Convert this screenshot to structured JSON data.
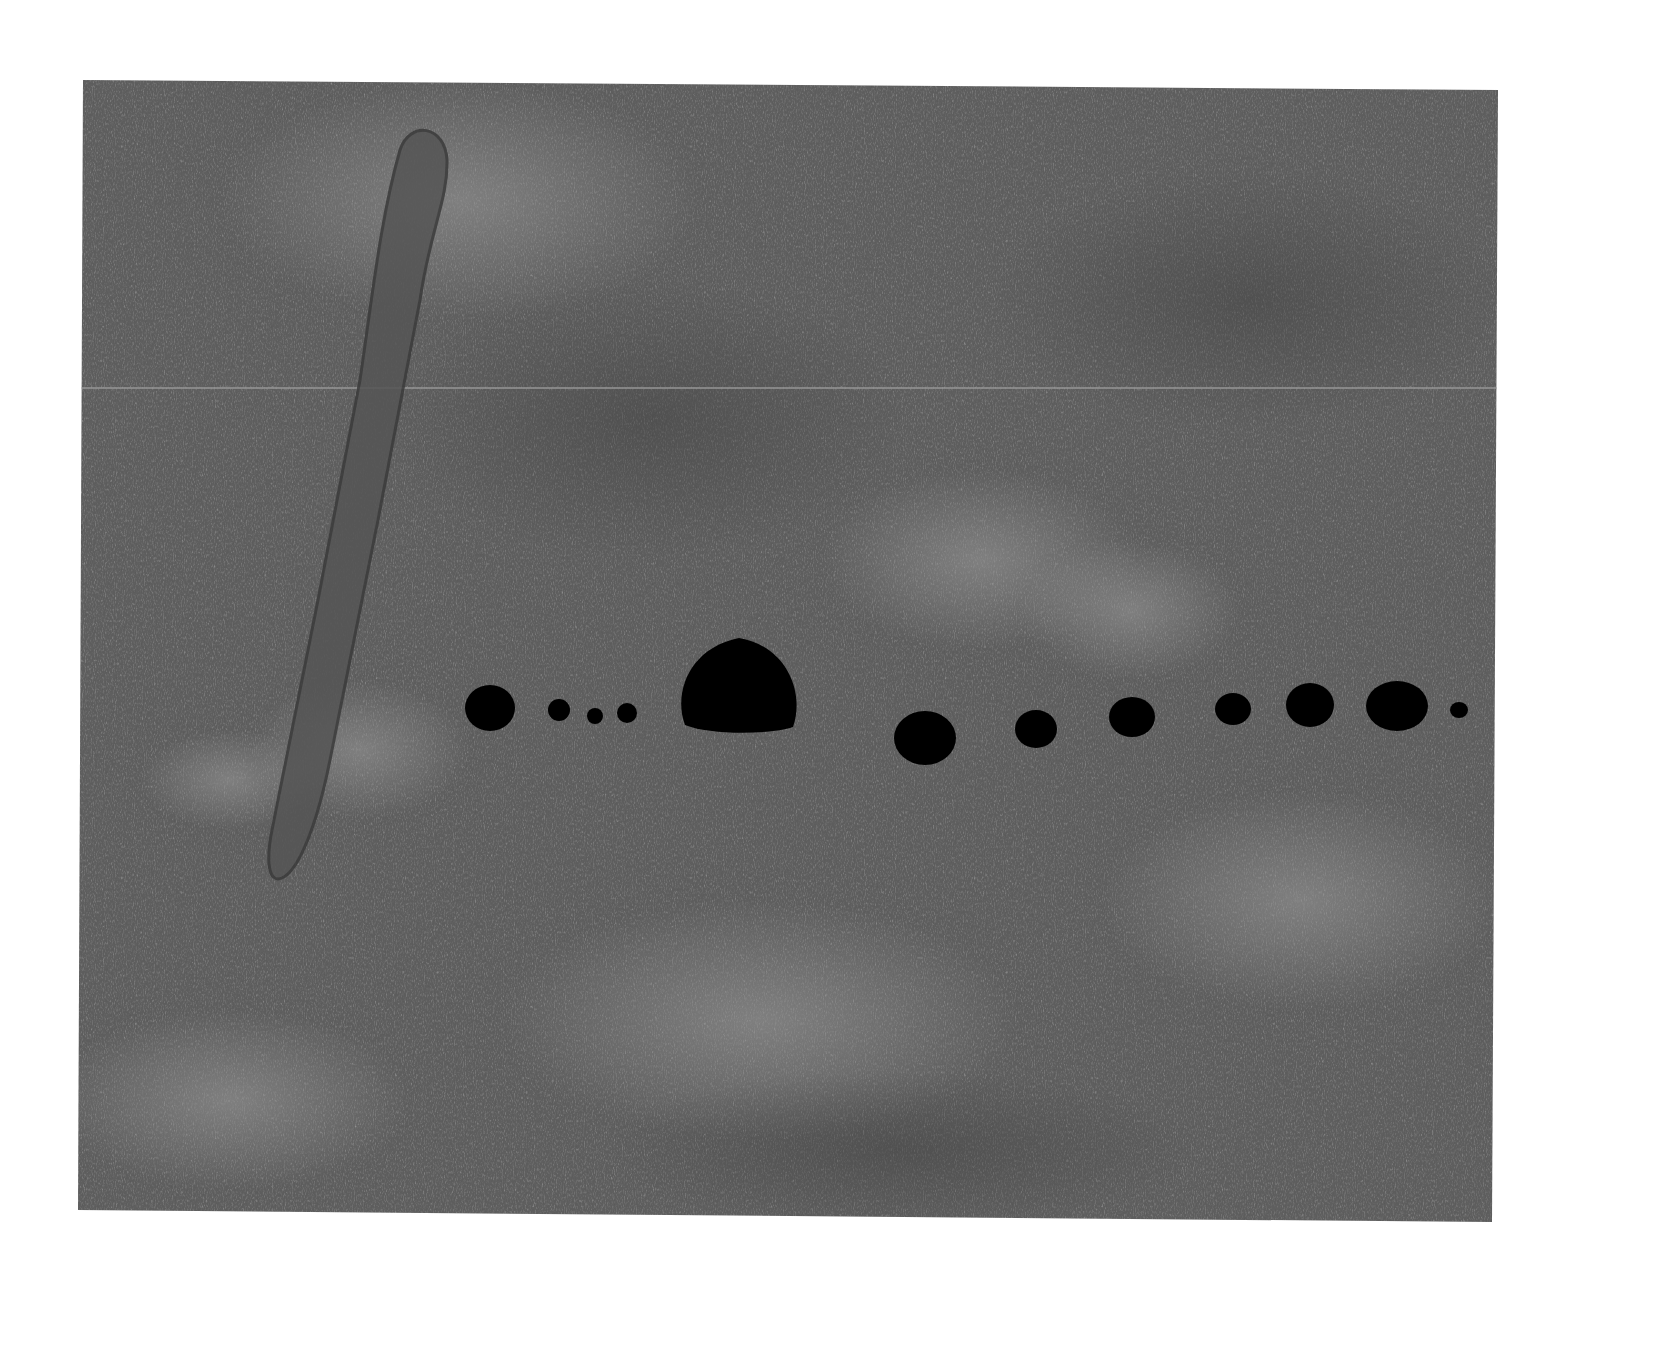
{
  "page": {
    "width": 1658,
    "height": 1370,
    "background": "#ffffff"
  },
  "canvas": {
    "corners": [
      [
        83,
        80
      ],
      [
        1498,
        90
      ],
      [
        1492,
        1222
      ],
      [
        78,
        1210
      ]
    ],
    "base_color": "#5f5f5f",
    "light_patch_color": "#8a8a8a",
    "dark_patch_color": "#4a4a4a",
    "seam": {
      "y": 388,
      "color": "#9a9a9a",
      "opacity": 0.7
    }
  },
  "stroke": {
    "description": "diagonal charcoal loop stroke",
    "path": "M 400 150 C 410 120, 445 125, 447 160 C 448 200, 430 230, 420 300 L 378 520 L 330 760 C 318 820, 300 870, 282 878 C 268 884, 266 860, 272 830 L 318 600 L 360 380 C 372 300, 380 220, 400 150 Z",
    "fill": "#555555",
    "outline": "#3a3a3a"
  },
  "dots": [
    {
      "cx": 490,
      "cy": 708,
      "rx": 25,
      "ry": 23
    },
    {
      "cx": 559,
      "cy": 710,
      "rx": 11,
      "ry": 11
    },
    {
      "cx": 595,
      "cy": 716,
      "rx": 8,
      "ry": 8
    },
    {
      "cx": 627,
      "cy": 713,
      "rx": 10,
      "ry": 10
    },
    {
      "cx": 739,
      "cy": 688,
      "rx": 60,
      "ry": 50,
      "shape": "dome"
    },
    {
      "cx": 925,
      "cy": 738,
      "rx": 31,
      "ry": 27
    },
    {
      "cx": 1036,
      "cy": 729,
      "rx": 21,
      "ry": 19
    },
    {
      "cx": 1132,
      "cy": 717,
      "rx": 23,
      "ry": 20
    },
    {
      "cx": 1233,
      "cy": 709,
      "rx": 18,
      "ry": 16
    },
    {
      "cx": 1310,
      "cy": 705,
      "rx": 24,
      "ry": 22
    },
    {
      "cx": 1397,
      "cy": 706,
      "rx": 31,
      "ry": 25
    },
    {
      "cx": 1459,
      "cy": 710,
      "rx": 9,
      "ry": 8
    }
  ],
  "dot_color": "#000000"
}
